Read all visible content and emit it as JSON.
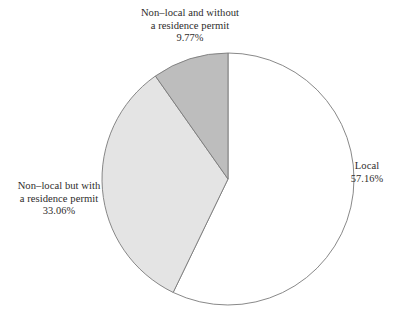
{
  "figure": {
    "title": "",
    "background_color": "#ffffff"
  },
  "chart_data": {
    "type": "pie",
    "title": "",
    "xlabel": "",
    "ylabel": "",
    "legend_position": "none",
    "grid": false,
    "start_angle_deg": 0,
    "direction": "clockwise",
    "categories": [
      "Local",
      "Non–local but with a residence permit",
      "Non–local and without a residence permit"
    ],
    "values": [
      57.16,
      33.06,
      9.77
    ],
    "value_unit": "%",
    "colors": [
      "#ffffff",
      "#e4e4e4",
      "#bdbdbd"
    ],
    "edge_color": "#7a7a7a",
    "labels": [
      {
        "name": "local",
        "lines": [
          "Local"
        ],
        "percent": "57.16%",
        "position": "right"
      },
      {
        "name": "nonlocal-with-permit",
        "lines": [
          "Non–local but with",
          "a residence permit"
        ],
        "percent": "33.06%",
        "position": "left"
      },
      {
        "name": "nonlocal-without-permit",
        "lines": [
          "Non–local and without",
          "a residence permit"
        ],
        "percent": "9.77%",
        "position": "top"
      }
    ]
  },
  "labels": {
    "local": {
      "line1": "Local",
      "percent": "57.16%"
    },
    "nonlocal_permit": {
      "line1": "Non–local but with",
      "line2": "a residence permit",
      "percent": "33.06%"
    },
    "nonlocal_nopermit": {
      "line1": "Non–local and without",
      "line2": "a residence permit",
      "percent": "9.77%"
    }
  }
}
